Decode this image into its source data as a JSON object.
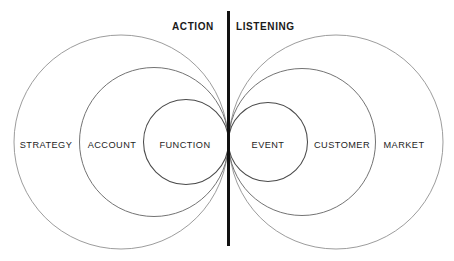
{
  "diagram": {
    "title_hidden": "",
    "headers": [
      {
        "label": "ACTION",
        "side": "left"
      },
      {
        "label": "LISTENING",
        "side": "right"
      }
    ],
    "divider": {
      "name": "vertical-divider",
      "x": 228.5,
      "y_top": 11,
      "y_bottom": 246,
      "color": "#111111",
      "width": 3
    },
    "left_side": {
      "name": "action-side",
      "zones": [
        {
          "label": "STRATEGY",
          "ring": "outer",
          "cx": 121.0,
          "cy": 142,
          "r": 107.0,
          "label_x": 46,
          "label_y": 146
        },
        {
          "label": "ACCOUNT",
          "ring": "middle",
          "cx": 154.0,
          "cy": 142,
          "r": 74.5,
          "label_x": 112,
          "label_y": 146
        },
        {
          "label": "FUNCTION",
          "ring": "inner",
          "cx": 186.0,
          "cy": 142,
          "r": 42.5,
          "label_x": 185,
          "label_y": 146
        }
      ]
    },
    "right_side": {
      "name": "listening-side",
      "zones": [
        {
          "label": "EVENT",
          "ring": "inner",
          "cx": 268.0,
          "cy": 142,
          "r": 39.5,
          "label_x": 268,
          "label_y": 146
        },
        {
          "label": "CUSTOMER",
          "ring": "middle",
          "cx": 302.0,
          "cy": 142,
          "r": 73.5,
          "label_x": 342,
          "label_y": 146
        },
        {
          "label": "MARKET",
          "ring": "outer",
          "cx": 336.0,
          "cy": 142,
          "r": 107.0,
          "label_x": 404,
          "label_y": 146
        }
      ]
    },
    "colors": {
      "stroke_outer": "#8a8a8a",
      "stroke_middle": "#6b6b6b",
      "stroke_inner": "#4a4a4a",
      "divider": "#111111",
      "text": "#1d1d1d",
      "background": "#ffffff"
    }
  }
}
